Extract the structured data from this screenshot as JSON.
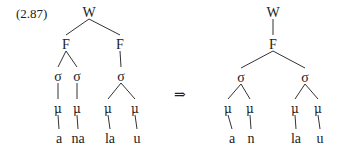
{
  "example_number": "(2.87)",
  "arrow": "⇒",
  "trees": [
    {
      "id": "input",
      "nodes": [
        {
          "id": "W",
          "label": "W"
        },
        {
          "id": "F1",
          "label": "F",
          "parent": "W"
        },
        {
          "id": "F2",
          "label": "F",
          "parent": "W"
        },
        {
          "id": "s1",
          "label": "σ",
          "parent": "F1"
        },
        {
          "id": "s2",
          "label": "σ",
          "parent": "F1"
        },
        {
          "id": "s3",
          "label": "σ",
          "parent": "F2"
        },
        {
          "id": "m1",
          "label": "μ",
          "parent": "s1"
        },
        {
          "id": "m2",
          "label": "μ",
          "parent": "s2"
        },
        {
          "id": "m3",
          "label": "μ",
          "parent": "s3"
        },
        {
          "id": "m4",
          "label": "μ",
          "parent": "s3"
        },
        {
          "id": "t1",
          "label": "a",
          "parent": "m1"
        },
        {
          "id": "t2",
          "label": "na",
          "parent": "m2"
        },
        {
          "id": "t3",
          "label": "la",
          "parent": "m3"
        },
        {
          "id": "t4",
          "label": "u",
          "parent": "m4"
        }
      ]
    },
    {
      "id": "output",
      "nodes": [
        {
          "id": "W",
          "label": "W"
        },
        {
          "id": "F1",
          "label": "F",
          "parent": "W"
        },
        {
          "id": "s1",
          "label": "σ",
          "parent": "F1"
        },
        {
          "id": "s2",
          "label": "σ",
          "parent": "F1"
        },
        {
          "id": "m1",
          "label": "μ",
          "parent": "s1"
        },
        {
          "id": "m2",
          "label": "μ",
          "parent": "s1"
        },
        {
          "id": "m3",
          "label": "μ",
          "parent": "s2"
        },
        {
          "id": "m4",
          "label": "μ",
          "parent": "s2"
        },
        {
          "id": "t1",
          "label": "a",
          "parent": "m1"
        },
        {
          "id": "t2",
          "label": "n",
          "parent": "m2"
        },
        {
          "id": "t3",
          "label": "la",
          "parent": "m3"
        },
        {
          "id": "t4",
          "label": "u",
          "parent": "m4"
        }
      ]
    }
  ]
}
